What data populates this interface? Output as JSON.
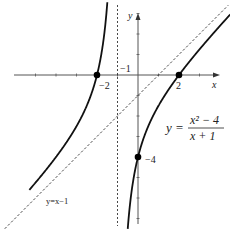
{
  "chart_data": {
    "type": "line",
    "title": "",
    "function_label": "y = (x^2 - 4)/(x + 1)",
    "equation": {
      "lhs": "y =",
      "numerator": "x² − 4",
      "denominator": "x + 1"
    },
    "xlabel": "x",
    "ylabel": "y",
    "xlim": [
      -6.7,
      4.5
    ],
    "ylim": [
      -7.4,
      3.7
    ],
    "grid": false,
    "series": [
      {
        "name": "y=(x^2-4)/(x+1)",
        "style": "solid",
        "branches": [
          "x < -1",
          "x > -1"
        ]
      },
      {
        "name": "y=x-1",
        "style": "dashed",
        "label": "y=x−1"
      },
      {
        "name": "x=-1",
        "style": "dashed",
        "label": "−1"
      }
    ],
    "points": [
      {
        "x": -2,
        "y": 0,
        "label": "−2"
      },
      {
        "x": 2,
        "y": 0,
        "label": "2"
      },
      {
        "x": 0,
        "y": -4,
        "label": "−4"
      }
    ],
    "tick_labels": {
      "x": [
        "−2",
        "−1",
        "2"
      ],
      "y": [
        "−4"
      ]
    }
  }
}
